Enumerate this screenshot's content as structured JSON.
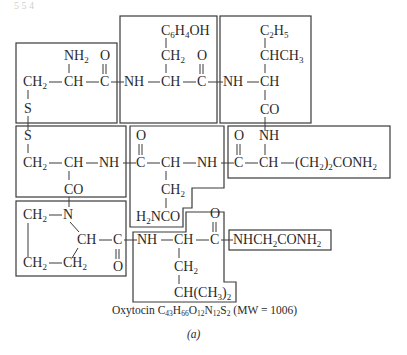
{
  "figure": {
    "label": "(a)",
    "caption": {
      "name": "Oxytocin",
      "formula": {
        "C": "43",
        "H": "66",
        "O": "12",
        "N": "12",
        "S": "2"
      },
      "mw_text": "(MW = 1006)"
    },
    "corner_mark": "5 5 4"
  },
  "residues": [
    {
      "id": "cys1",
      "groups": {
        "nh2": "NH",
        "nh2_sub": "2",
        "ch2": "CH",
        "ch2_sub": "2",
        "ch": "CH",
        "c": "C",
        "o": "O",
        "s": "S"
      }
    },
    {
      "id": "tyr2",
      "groups": {
        "nh": "NH",
        "ch": "CH",
        "c": "C",
        "o": "O",
        "ch2": "CH",
        "ch2_sub": "2",
        "side": "C",
        "side_sub1": "6",
        "side_mid": "H",
        "side_sub2": "4",
        "side_end": "OH"
      }
    },
    {
      "id": "ile3",
      "groups": {
        "nh": "NH",
        "ch": "CH",
        "co": "CO",
        "chch3": "CHCH",
        "chch3_sub": "3",
        "c2h5": "C",
        "c2h5_sub1": "2",
        "c2h5_mid": "H",
        "c2h5_sub2": "5"
      }
    },
    {
      "id": "gln4",
      "groups": {
        "nh": "NH",
        "ch": "CH",
        "c": "C",
        "o": "O",
        "side": "(CH",
        "side_sub1": "2",
        "side_mid": ")",
        "side_sub2": "2",
        "side_end": "CONH",
        "side_sub3": "2"
      }
    },
    {
      "id": "asn5",
      "groups": {
        "nh": "NH",
        "ch": "CH",
        "c": "C",
        "o": "O",
        "ch2": "CH",
        "ch2_sub": "2",
        "amide_pre": "H",
        "amide_sub": "2",
        "amide": "NCO"
      }
    },
    {
      "id": "cys6",
      "groups": {
        "s": "S",
        "ch2": "CH",
        "ch2_sub": "2",
        "ch": "CH",
        "nh": "NH",
        "co": "CO"
      }
    },
    {
      "id": "pro7",
      "groups": {
        "n": "N",
        "ch2a": "CH",
        "ch2a_sub": "2",
        "ch": "CH",
        "c": "C",
        "o": "O",
        "ch2b": "CH",
        "ch2b_sub": "2",
        "ch2c": "CH",
        "ch2c_sub": "2"
      }
    },
    {
      "id": "leu8",
      "groups": {
        "nh": "NH",
        "ch": "CH",
        "c": "C",
        "o": "O",
        "ch2": "CH",
        "ch2_sub": "2",
        "side": "CH(CH",
        "side_sub1": "3",
        "side_end": ")",
        "side_sub2": "2"
      }
    },
    {
      "id": "gly9",
      "groups": {
        "text": "NHCH",
        "sub1": "2",
        "text2": "CONH",
        "sub2": "2"
      }
    }
  ]
}
